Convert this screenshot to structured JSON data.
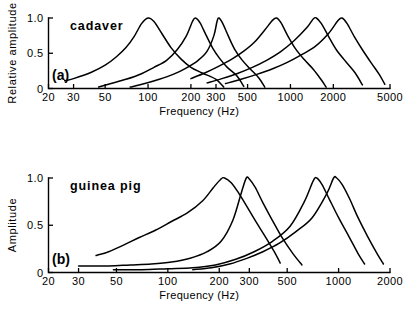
{
  "figure": {
    "panels": [
      "a",
      "b"
    ]
  },
  "chart_data": [
    {
      "type": "line",
      "panel_letter": "(a)",
      "title": "cadaver",
      "xlabel": "Frequency (Hz)",
      "ylabel": "Relative amplitude",
      "xscale": "log",
      "xlim": [
        20,
        5000
      ],
      "ylim": [
        0,
        1.0
      ],
      "xticks": [
        20,
        30,
        50,
        100,
        200,
        300,
        500,
        1000,
        2000,
        5000
      ],
      "xticklabels": [
        "20",
        "30",
        "50",
        "100",
        "200",
        "300",
        "500",
        "1000",
        "2000",
        "5000"
      ],
      "yticks": [
        0,
        0.5,
        1.0
      ],
      "yticklabels": [
        "0",
        "0.5",
        "1.0"
      ],
      "grid": false,
      "legend": "none",
      "series": [
        {
          "name": "curve-1",
          "peak_hz": 100,
          "peak_value": 1.0,
          "points": [
            [
              26,
              0.11
            ],
            [
              30,
              0.14
            ],
            [
              40,
              0.23
            ],
            [
              50,
              0.33
            ],
            [
              60,
              0.45
            ],
            [
              70,
              0.58
            ],
            [
              80,
              0.74
            ],
            [
              90,
              0.92
            ],
            [
              100,
              1.0
            ],
            [
              110,
              0.95
            ],
            [
              125,
              0.78
            ],
            [
              145,
              0.58
            ],
            [
              170,
              0.42
            ],
            [
              200,
              0.3
            ],
            [
              240,
              0.22
            ],
            [
              300,
              0.13
            ],
            [
              340,
              0.02
            ]
          ]
        },
        {
          "name": "curve-2",
          "peak_hz": 215,
          "peak_value": 1.0,
          "points": [
            [
              45,
              0.02
            ],
            [
              55,
              0.07
            ],
            [
              70,
              0.13
            ],
            [
              90,
              0.21
            ],
            [
              110,
              0.3
            ],
            [
              135,
              0.4
            ],
            [
              160,
              0.55
            ],
            [
              185,
              0.74
            ],
            [
              205,
              0.95
            ],
            [
              215,
              1.0
            ],
            [
              232,
              0.93
            ],
            [
              255,
              0.76
            ],
            [
              285,
              0.57
            ],
            [
              320,
              0.42
            ],
            [
              360,
              0.3
            ],
            [
              420,
              0.18
            ],
            [
              470,
              0.03
            ]
          ]
        },
        {
          "name": "curve-3",
          "peak_hz": 310,
          "peak_value": 1.0,
          "points": [
            [
              75,
              0.02
            ],
            [
              95,
              0.07
            ],
            [
              120,
              0.13
            ],
            [
              150,
              0.2
            ],
            [
              185,
              0.29
            ],
            [
              225,
              0.4
            ],
            [
              260,
              0.53
            ],
            [
              290,
              0.75
            ],
            [
              305,
              0.95
            ],
            [
              315,
              1.0
            ],
            [
              335,
              0.92
            ],
            [
              365,
              0.75
            ],
            [
              405,
              0.56
            ],
            [
              455,
              0.41
            ],
            [
              520,
              0.28
            ],
            [
              600,
              0.15
            ],
            [
              660,
              0.02
            ]
          ]
        },
        {
          "name": "curve-4",
          "peak_hz": 800,
          "peak_value": 1.0,
          "points": [
            [
              200,
              0.14
            ],
            [
              250,
              0.22
            ],
            [
              310,
              0.31
            ],
            [
              390,
              0.42
            ],
            [
              470,
              0.53
            ],
            [
              560,
              0.66
            ],
            [
              660,
              0.83
            ],
            [
              750,
              0.97
            ],
            [
              800,
              1.0
            ],
            [
              860,
              0.93
            ],
            [
              950,
              0.76
            ],
            [
              1080,
              0.57
            ],
            [
              1250,
              0.41
            ],
            [
              1450,
              0.27
            ],
            [
              1650,
              0.12
            ],
            [
              1780,
              0.02
            ]
          ]
        },
        {
          "name": "curve-5",
          "peak_hz": 1500,
          "peak_value": 1.0,
          "points": [
            [
              260,
              0.08
            ],
            [
              330,
              0.14
            ],
            [
              420,
              0.21
            ],
            [
              540,
              0.3
            ],
            [
              680,
              0.4
            ],
            [
              850,
              0.52
            ],
            [
              1050,
              0.67
            ],
            [
              1300,
              0.86
            ],
            [
              1450,
              0.99
            ],
            [
              1520,
              1.0
            ],
            [
              1650,
              0.92
            ],
            [
              1850,
              0.74
            ],
            [
              2100,
              0.55
            ],
            [
              2450,
              0.38
            ],
            [
              2850,
              0.22
            ],
            [
              3200,
              0.05
            ]
          ]
        },
        {
          "name": "curve-6",
          "peak_hz": 2300,
          "peak_value": 1.0,
          "points": [
            [
              350,
              0.07
            ],
            [
              450,
              0.13
            ],
            [
              580,
              0.2
            ],
            [
              750,
              0.28
            ],
            [
              950,
              0.37
            ],
            [
              1200,
              0.48
            ],
            [
              1500,
              0.6
            ],
            [
              1850,
              0.78
            ],
            [
              2150,
              0.96
            ],
            [
              2300,
              1.0
            ],
            [
              2500,
              0.92
            ],
            [
              2800,
              0.74
            ],
            [
              3200,
              0.55
            ],
            [
              3700,
              0.36
            ],
            [
              4200,
              0.2
            ],
            [
              4600,
              0.06
            ]
          ]
        }
      ]
    },
    {
      "type": "line",
      "panel_letter": "(b)",
      "title": "guinea pig",
      "xlabel": "Frequency (Hz)",
      "ylabel": "Amplitude",
      "xscale": "log",
      "xlim": [
        20,
        2000
      ],
      "ylim": [
        0,
        1.0
      ],
      "xticks": [
        20,
        30,
        50,
        100,
        200,
        300,
        500,
        1000,
        2000
      ],
      "xticklabels": [
        "20",
        "30",
        "50",
        "100",
        "200",
        "300",
        "500",
        "1000",
        "2000"
      ],
      "yticks": [
        0,
        0.5,
        1.0
      ],
      "yticklabels": [
        "0",
        "0.5",
        "1.0"
      ],
      "grid": false,
      "legend": "none",
      "series": [
        {
          "name": "curve-1",
          "peak_hz": 210,
          "peak_value": 1.0,
          "points": [
            [
              38,
              0.18
            ],
            [
              45,
              0.22
            ],
            [
              55,
              0.29
            ],
            [
              68,
              0.37
            ],
            [
              85,
              0.45
            ],
            [
              105,
              0.54
            ],
            [
              130,
              0.63
            ],
            [
              160,
              0.76
            ],
            [
              185,
              0.9
            ],
            [
              205,
              0.99
            ],
            [
              215,
              1.0
            ],
            [
              235,
              0.95
            ],
            [
              260,
              0.84
            ],
            [
              290,
              0.7
            ],
            [
              330,
              0.53
            ],
            [
              375,
              0.37
            ],
            [
              420,
              0.22
            ],
            [
              455,
              0.1
            ]
          ]
        },
        {
          "name": "curve-2",
          "peak_hz": 290,
          "peak_value": 1.0,
          "points": [
            [
              30,
              0.07
            ],
            [
              45,
              0.07
            ],
            [
              60,
              0.08
            ],
            [
              80,
              0.09
            ],
            [
              105,
              0.11
            ],
            [
              135,
              0.15
            ],
            [
              170,
              0.22
            ],
            [
              205,
              0.33
            ],
            [
              240,
              0.55
            ],
            [
              270,
              0.85
            ],
            [
              288,
              1.0
            ],
            [
              300,
              0.99
            ],
            [
              325,
              0.9
            ],
            [
              360,
              0.74
            ],
            [
              410,
              0.55
            ],
            [
              470,
              0.36
            ],
            [
              540,
              0.2
            ],
            [
              610,
              0.08
            ]
          ]
        },
        {
          "name": "curve-3",
          "peak_hz": 730,
          "peak_value": 1.0,
          "points": [
            [
              48,
              0.03
            ],
            [
              70,
              0.03
            ],
            [
              100,
              0.04
            ],
            [
              140,
              0.05
            ],
            [
              190,
              0.08
            ],
            [
              250,
              0.14
            ],
            [
              320,
              0.22
            ],
            [
              410,
              0.33
            ],
            [
              520,
              0.49
            ],
            [
              630,
              0.75
            ],
            [
              710,
              0.97
            ],
            [
              745,
              1.0
            ],
            [
              800,
              0.93
            ],
            [
              880,
              0.78
            ],
            [
              1000,
              0.58
            ],
            [
              1150,
              0.38
            ],
            [
              1300,
              0.2
            ],
            [
              1420,
              0.09
            ]
          ]
        },
        {
          "name": "curve-4",
          "peak_hz": 950,
          "peak_value": 1.0,
          "points": [
            [
              140,
              0.03
            ],
            [
              180,
              0.05
            ],
            [
              230,
              0.09
            ],
            [
              290,
              0.15
            ],
            [
              360,
              0.22
            ],
            [
              450,
              0.31
            ],
            [
              560,
              0.43
            ],
            [
              700,
              0.58
            ],
            [
              850,
              0.83
            ],
            [
              935,
              1.0
            ],
            [
              975,
              1.0
            ],
            [
              1050,
              0.93
            ],
            [
              1160,
              0.78
            ],
            [
              1300,
              0.58
            ],
            [
              1480,
              0.38
            ],
            [
              1680,
              0.2
            ],
            [
              1830,
              0.09
            ]
          ]
        }
      ]
    }
  ]
}
